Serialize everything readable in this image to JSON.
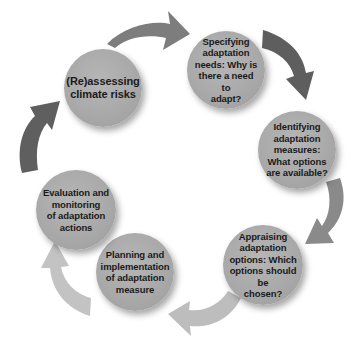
{
  "diagram": {
    "type": "cycle",
    "nodes": [
      {
        "id": "reassessing",
        "label": "(Re)assessing\nclimate risks",
        "cx": 103,
        "cy": 88,
        "r": 39
      },
      {
        "id": "specifying",
        "label": "Specifying\nadaptation\nneeds: Why is\nthere a need to\nadapt?",
        "cx": 226,
        "cy": 70,
        "r": 39
      },
      {
        "id": "identifying",
        "label": "Identifying\nadaptation\nmeasures:\nWhat options\nare available?",
        "cx": 297,
        "cy": 150,
        "r": 39
      },
      {
        "id": "appraising",
        "label": "Appraising\nadaptation\noptions: Which\noptions should be\nchosen?",
        "cx": 263,
        "cy": 265,
        "r": 40
      },
      {
        "id": "planning",
        "label": "Planning and\nimplementation\nof adaptation\nmeasure",
        "cx": 135,
        "cy": 272,
        "r": 39
      },
      {
        "id": "evaluation",
        "label": "Evaluation and\nmonitoring\nof adaptation\nactions",
        "cx": 76,
        "cy": 210,
        "r": 40
      }
    ],
    "arrows": [
      {
        "from": "reassessing",
        "to": "specifying",
        "color": "#7d7d7d"
      },
      {
        "from": "specifying",
        "to": "identifying",
        "color": "#5e5e5e"
      },
      {
        "from": "identifying",
        "to": "appraising",
        "color": "#8a8a8a"
      },
      {
        "from": "appraising",
        "to": "planning",
        "color": "#bdbdbd"
      },
      {
        "from": "planning",
        "to": "evaluation",
        "color": "#c3c3c3"
      },
      {
        "from": "evaluation",
        "to": "reassessing",
        "color": "#5f5f5f"
      }
    ]
  }
}
